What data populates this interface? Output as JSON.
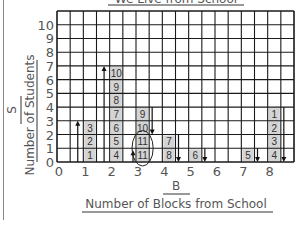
{
  "chart_data": {
    "type": "bar",
    "title": "We Live from School",
    "xlabel": "Number of Blocks from School",
    "ylabel": "Number of Students",
    "x_axis_letter": "B",
    "y_axis_letter": "S",
    "categories": [
      "0",
      "1",
      "2",
      "3",
      "4",
      "5",
      "6",
      "7",
      "8"
    ],
    "values": [
      0,
      3,
      7,
      4,
      2,
      1,
      0,
      1,
      4
    ],
    "ylim": [
      0,
      10
    ],
    "y_ticks": [
      "0",
      "1",
      "2",
      "3",
      "4",
      "5",
      "6",
      "7",
      "8",
      "9",
      "10"
    ],
    "grid": true,
    "bars": [
      {
        "x": 1,
        "cell_labels": [
          "1",
          "2",
          "3"
        ],
        "arrow": "up",
        "arrow_to": 3
      },
      {
        "x": 2,
        "cell_labels": [
          "4",
          "5",
          "6",
          "7",
          "8",
          "9",
          "10"
        ],
        "arrow": "up",
        "arrow_to": 7
      },
      {
        "x": 3,
        "cell_labels": [
          "11",
          "11",
          "10",
          "9"
        ],
        "arrow": "down",
        "arrow_from": 4,
        "arrow_to": 2,
        "small_up_arrow": true,
        "circled_cells": [
          0,
          1
        ]
      },
      {
        "x": 4,
        "cell_labels": [
          "8",
          "7"
        ],
        "arrow": "down",
        "arrow_from": 2,
        "arrow_to": 0
      },
      {
        "x": 5,
        "cell_labels": [
          "6"
        ],
        "arrow": "down",
        "arrow_from": 1,
        "arrow_to": 0
      },
      {
        "x": 7,
        "cell_labels": [
          "5"
        ],
        "arrow": "down",
        "arrow_from": 1,
        "arrow_to": 0
      },
      {
        "x": 8,
        "cell_labels": [
          "4",
          "3",
          "2",
          "1"
        ],
        "arrow": "down",
        "arrow_from": 4,
        "arrow_to": 0
      }
    ]
  },
  "colors": {
    "grid": "#1a1a1a",
    "bar_fill": "#d4d4d4",
    "text": "#555555",
    "border": "#888888"
  }
}
